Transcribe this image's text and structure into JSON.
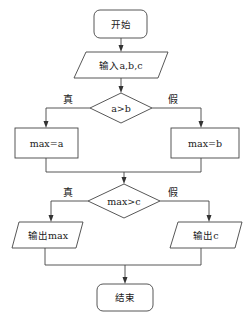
{
  "diagram": {
    "type": "flowchart",
    "line_color": "#333333",
    "background": "#ffffff",
    "nodes": {
      "start": {
        "label": "开始",
        "shape": "rounded-rect"
      },
      "input": {
        "label": "输入a,b,c",
        "shape": "parallelogram"
      },
      "cond1": {
        "label": "a>b",
        "shape": "diamond"
      },
      "assign_a": {
        "label": "max=a",
        "shape": "rect"
      },
      "assign_b": {
        "label": "max=b",
        "shape": "rect"
      },
      "cond2": {
        "label": "max>c",
        "shape": "diamond"
      },
      "out_max": {
        "label": "输出max",
        "shape": "parallelogram"
      },
      "out_c": {
        "label": "输出c",
        "shape": "parallelogram"
      },
      "end": {
        "label": "结束",
        "shape": "rounded-rect"
      }
    },
    "branch_labels": {
      "cond1_true": "真",
      "cond1_false": "假",
      "cond2_true": "真",
      "cond2_false": "假"
    },
    "edges": [
      {
        "from": "start",
        "to": "input"
      },
      {
        "from": "input",
        "to": "cond1"
      },
      {
        "from": "cond1",
        "to": "assign_a",
        "label": "真"
      },
      {
        "from": "cond1",
        "to": "assign_b",
        "label": "假"
      },
      {
        "from": "assign_a",
        "to": "cond2"
      },
      {
        "from": "assign_b",
        "to": "cond2"
      },
      {
        "from": "cond2",
        "to": "out_max",
        "label": "真"
      },
      {
        "from": "cond2",
        "to": "out_c",
        "label": "假"
      },
      {
        "from": "out_max",
        "to": "end"
      },
      {
        "from": "out_c",
        "to": "end"
      }
    ]
  }
}
